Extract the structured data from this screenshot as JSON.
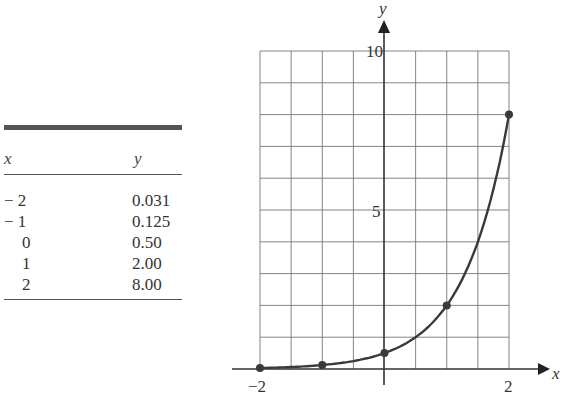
{
  "table": {
    "headers": {
      "x": "x",
      "y": "y"
    },
    "rows": [
      {
        "x": "− 2",
        "y": "0.031"
      },
      {
        "x": "− 1",
        "y": "0.125"
      },
      {
        "x": "0",
        "y": "0.50"
      },
      {
        "x": "1",
        "y": "2.00"
      },
      {
        "x": "2",
        "y": "8.00"
      }
    ]
  },
  "axes": {
    "x_label": "x",
    "y_label": "y",
    "x_tick_neg": "−2",
    "x_tick_pos": "2",
    "y_tick_5": "5",
    "y_tick_10": "10"
  },
  "chart_data": {
    "type": "line",
    "title": "",
    "xlabel": "x",
    "ylabel": "y",
    "x": [
      -2,
      -1,
      0,
      1,
      2
    ],
    "values": [
      0.031,
      0.125,
      0.5,
      2.0,
      8.0
    ],
    "series": [
      {
        "name": "y = 0.5·4^x",
        "x": [
          -2,
          -1,
          0,
          1,
          2
        ],
        "values": [
          0.031,
          0.125,
          0.5,
          2.0,
          8.0
        ]
      }
    ],
    "xlim": [
      -2,
      2
    ],
    "ylim": [
      0,
      10
    ],
    "x_ticks": [
      -2,
      2
    ],
    "y_ticks": [
      5,
      10
    ],
    "grid": true,
    "grid_x_step": 0.5,
    "grid_y_step": 1,
    "legend": "none",
    "markers": true,
    "table": {
      "columns": [
        "x",
        "y"
      ],
      "rows": [
        [
          -2,
          0.031
        ],
        [
          -1,
          0.125
        ],
        [
          0,
          0.5
        ],
        [
          1,
          2.0
        ],
        [
          2,
          8.0
        ]
      ]
    }
  }
}
